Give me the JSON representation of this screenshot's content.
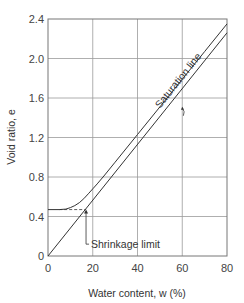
{
  "chart_data": {
    "type": "line",
    "title": "",
    "xlabel": "Water content, w (%)",
    "ylabel": "Void ratio, e",
    "xlim": [
      0,
      80
    ],
    "ylim": [
      0,
      2.4
    ],
    "grid": true,
    "x_ticks": [
      0,
      20,
      40,
      60,
      80
    ],
    "x_tick_labels": [
      "0",
      "20",
      "40",
      "60",
      "80"
    ],
    "y_ticks": [
      0,
      0.4,
      0.8,
      1.2,
      1.6,
      2.0,
      2.4
    ],
    "y_tick_labels": [
      "0",
      "0.4",
      "0.8",
      "1.2",
      "1.6",
      "2.0",
      "2.4"
    ],
    "series": [
      {
        "name": "Saturation line",
        "x": [
          0,
          80
        ],
        "y": [
          0,
          2.26
        ]
      },
      {
        "name": "Shrinkage curve",
        "x": [
          0,
          5,
          8,
          10,
          12,
          14,
          16,
          18,
          20,
          22,
          25,
          30,
          40,
          50,
          60,
          70,
          80
        ],
        "y": [
          0.47,
          0.47,
          0.475,
          0.49,
          0.51,
          0.54,
          0.58,
          0.63,
          0.68,
          0.73,
          0.81,
          0.95,
          1.23,
          1.51,
          1.79,
          2.07,
          2.35
        ]
      }
    ],
    "annotations": [
      {
        "text": "Saturation line",
        "target": "Saturation line"
      },
      {
        "text": "Shrinkage limit",
        "x": 17,
        "y": 0.47
      }
    ],
    "shrinkage_limit": {
      "w": 17,
      "e": 0.47
    }
  }
}
